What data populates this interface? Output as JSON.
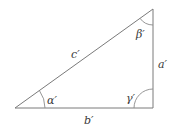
{
  "diagram": {
    "type": "right-triangle",
    "colors": {
      "edge": "#7a7a7a",
      "label": "#3a3a3a",
      "background": "#ffffff"
    },
    "vertices": {
      "A": {
        "x": 15,
        "y": 108,
        "role": "angle alpha"
      },
      "C": {
        "x": 153,
        "y": 108,
        "role": "right angle gamma"
      },
      "B": {
        "x": 153,
        "y": 9,
        "role": "angle beta"
      }
    },
    "sides": {
      "hypotenuse": {
        "label": "c′"
      },
      "vertical": {
        "label": "a′"
      },
      "base": {
        "label": "b′"
      }
    },
    "angles": {
      "alpha": {
        "label": "α′"
      },
      "beta": {
        "label": "β′"
      },
      "gamma": {
        "label": "γ′"
      }
    }
  }
}
